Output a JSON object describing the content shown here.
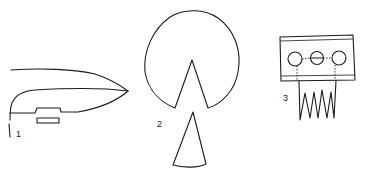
{
  "figures": [
    {
      "id": 1,
      "label": "1",
      "shape": "blade-profile"
    },
    {
      "id": 2,
      "label": "2",
      "shape": "circle-with-wedge-cutout"
    },
    {
      "id": 3,
      "label": "3",
      "shape": "plate-with-three-holes-and-teeth"
    }
  ],
  "colors": {
    "line": "#1a1a1a",
    "background": "#ffffff"
  }
}
